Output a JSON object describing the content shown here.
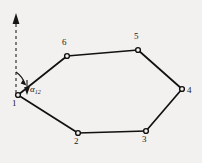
{
  "figure": {
    "type": "polygon-traverse-diagram",
    "background_color": "#f2f1ef",
    "line_color": "#111111",
    "vertex_fill_color": "#f2f1ef",
    "vertices": [
      {
        "id": "1",
        "label": "1",
        "x": 18,
        "y": 95,
        "label_x": 13,
        "label_y": 100
      },
      {
        "id": "2",
        "label": "2",
        "x": 78,
        "y": 133,
        "label_x": 75,
        "label_y": 138
      },
      {
        "id": "3",
        "label": "3",
        "x": 146,
        "y": 131,
        "label_x": 143,
        "label_y": 136
      },
      {
        "id": "4",
        "label": "4",
        "x": 182,
        "y": 89,
        "label_x": 187,
        "label_y": 87
      },
      {
        "id": "5",
        "label": "5",
        "x": 138,
        "y": 50,
        "label_x": 135,
        "label_y": 33
      },
      {
        "id": "6",
        "label": "6",
        "x": 67,
        "y": 56,
        "label_x": 63,
        "label_y": 39
      }
    ],
    "edges": [
      {
        "from": "1",
        "to": "2"
      },
      {
        "from": "2",
        "to": "3"
      },
      {
        "from": "3",
        "to": "4"
      },
      {
        "from": "4",
        "to": "5"
      },
      {
        "from": "5",
        "to": "6"
      },
      {
        "from": "6",
        "to": "1"
      }
    ],
    "meridian": {
      "name": "north-reference-dashed-line",
      "x": 16,
      "y_top": 14,
      "y_bottom": 93,
      "dash": "3 3",
      "arrow_head": "up"
    },
    "angle": {
      "symbol": "α",
      "subscript": "12",
      "label_x": 29,
      "label_y": 87,
      "from_direction": "north",
      "to_station": "2"
    }
  }
}
